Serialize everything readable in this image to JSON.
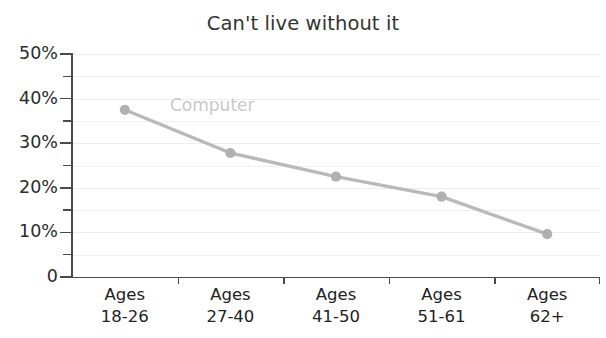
{
  "chart_data": {
    "type": "line",
    "title": "Can't live without it",
    "xlabel": "",
    "ylabel": "",
    "categories": [
      "Ages 18-26",
      "Ages 27-40",
      "Ages 41-50",
      "Ages 51-61",
      "Ages 62+"
    ],
    "category_lines": [
      {
        "line1": "Ages",
        "line2": "18-26"
      },
      {
        "line1": "Ages",
        "line2": "27-40"
      },
      {
        "line1": "Ages",
        "line2": "41-50"
      },
      {
        "line1": "Ages",
        "line2": "51-61"
      },
      {
        "line1": "Ages",
        "line2": "62+"
      }
    ],
    "series": [
      {
        "name": "Computer",
        "values": [
          37.5,
          27.8,
          22.5,
          18.0,
          9.6
        ],
        "color": "#b9b9b9",
        "marker_color": "#b0b0b0",
        "label_color": "#c9c9c9"
      }
    ],
    "ylim": [
      0,
      50
    ],
    "ytick_values": [
      0,
      5,
      10,
      15,
      20,
      25,
      30,
      35,
      40,
      45,
      50
    ],
    "ytick_major_values": [
      0,
      10,
      20,
      30,
      40,
      50
    ],
    "ytick_labels": [
      "0",
      "10%",
      "20%",
      "30%",
      "40%",
      "50%"
    ],
    "grid": true,
    "grid_color": "#f0f0f0",
    "legend": "inline-series-label",
    "axis_color": "#4a4a4a",
    "title_color": "#333333",
    "tick_label_color": "#2b2b2b"
  },
  "annotations": {
    "series_label_text": "Computer"
  }
}
